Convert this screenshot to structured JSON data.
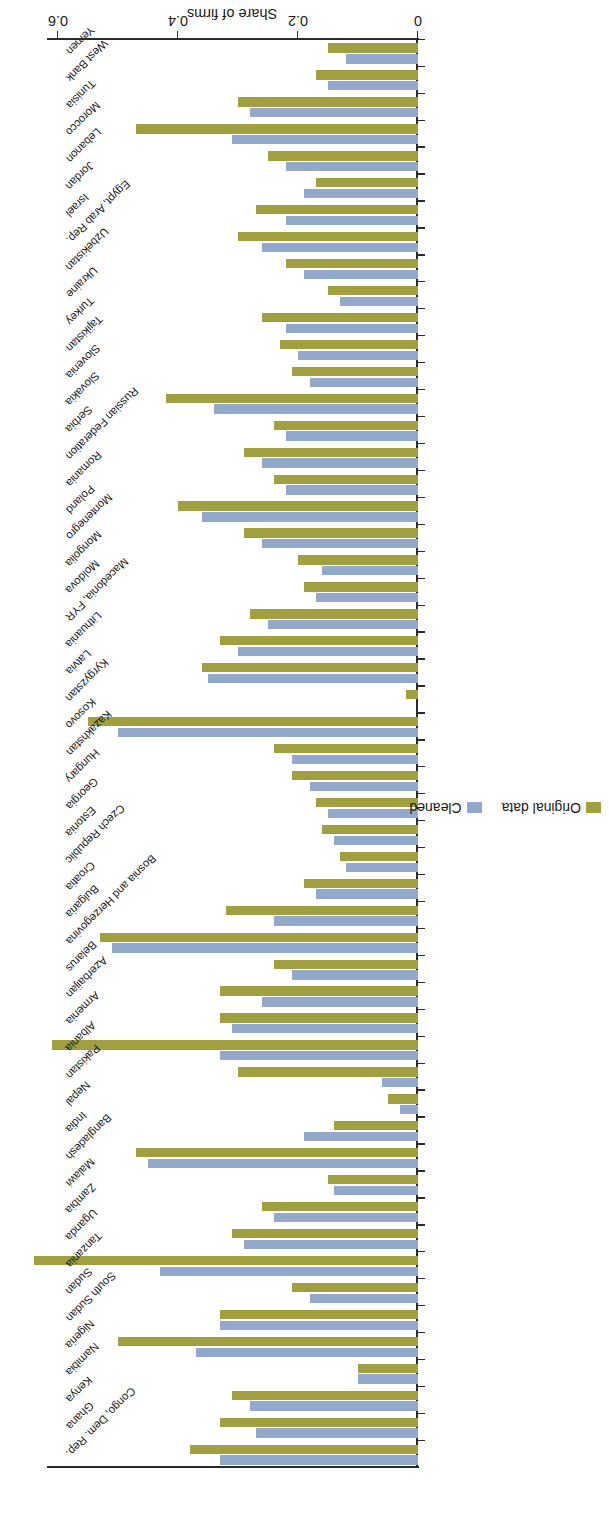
{
  "chart_data": {
    "type": "bar",
    "orientation": "horizontal",
    "title": "",
    "subtitle": "",
    "xlabel": "Share of firms",
    "ylabel": "",
    "xlim": [
      0,
      0.62
    ],
    "xticks": [
      0,
      0.2,
      0.4,
      0.6
    ],
    "xtick_labels": [
      "0",
      "0.2",
      "0.4",
      "0.6"
    ],
    "grid": false,
    "legend_position": "bottom-left",
    "legend": [
      {
        "name": "Original data",
        "color": "#a0a040"
      },
      {
        "name": "Cleaned",
        "color": "#92a9cb"
      }
    ],
    "series": [
      {
        "name": "Original data",
        "color": "#a0a040"
      },
      {
        "name": "Cleaned",
        "color": "#92a9cb"
      }
    ],
    "categories": [
      "Congo, Dem. Rep.",
      "Ghana",
      "Kenya",
      "Namibia",
      "Nigeria",
      "South Sudan",
      "Sudan",
      "Tanzania",
      "Uganda",
      "Zambia",
      "Malawi",
      "Bangladesh",
      "India",
      "Nepal",
      "Pakistan",
      "Albania",
      "Armenia",
      "Azerbaijan",
      "Belarus",
      "Bosnia and Herzegovina",
      "Bulgaria",
      "Croatia",
      "Czech Republic",
      "Estonia",
      "Georgia",
      "Hungary",
      "Kazakhstan",
      "Kosovo",
      "Kyrgyzstan",
      "Latvia",
      "Lithuania",
      "Macedonia, FYR",
      "Moldova",
      "Mongolia",
      "Montenegro",
      "Poland",
      "Romania",
      "Russian Federation",
      "Serbia",
      "Slovakia",
      "Slovenia",
      "Tajikistan",
      "Turkey",
      "Ukraine",
      "Uzbekistan",
      "Egypt, Arab Rep.",
      "Israel",
      "Jordan",
      "Lebanon",
      "Morocco",
      "Tunisia",
      "West Bank",
      "Yemen"
    ],
    "values": {
      "Original data": [
        0.38,
        0.33,
        0.31,
        0.1,
        0.5,
        0.33,
        0.21,
        0.64,
        0.31,
        0.26,
        0.15,
        0.47,
        0.14,
        0.05,
        0.3,
        0.61,
        0.33,
        0.33,
        0.24,
        0.53,
        0.32,
        0.19,
        0.13,
        0.16,
        0.17,
        0.21,
        0.24,
        0.55,
        0.02,
        0.36,
        0.33,
        0.28,
        0.19,
        0.2,
        0.29,
        0.4,
        0.24,
        0.29,
        0.24,
        0.42,
        0.21,
        0.23,
        0.26,
        0.15,
        0.22,
        0.3,
        0.27,
        0.17,
        0.25,
        0.47,
        0.3,
        0.17,
        0.15
      ],
      "Cleaned": [
        0.33,
        0.27,
        0.28,
        0.1,
        0.37,
        0.33,
        0.18,
        0.43,
        0.29,
        0.24,
        0.14,
        0.45,
        0.19,
        0.03,
        0.06,
        0.33,
        0.31,
        0.26,
        0.21,
        0.51,
        0.24,
        0.17,
        0.12,
        0.14,
        0.15,
        0.18,
        0.21,
        0.5,
        0.0,
        0.35,
        0.3,
        0.25,
        0.17,
        0.16,
        0.26,
        0.36,
        0.22,
        0.26,
        0.22,
        0.34,
        0.18,
        0.2,
        0.22,
        0.13,
        0.19,
        0.26,
        0.22,
        0.19,
        0.22,
        0.31,
        0.28,
        0.15,
        0.12
      ]
    }
  },
  "axis": {
    "title": "Share of firms",
    "tick_labels": [
      "0",
      "0.2",
      "0.4",
      "0.6"
    ]
  },
  "legend": {
    "original_label": "Original data",
    "cleaned_label": "Cleaned"
  }
}
